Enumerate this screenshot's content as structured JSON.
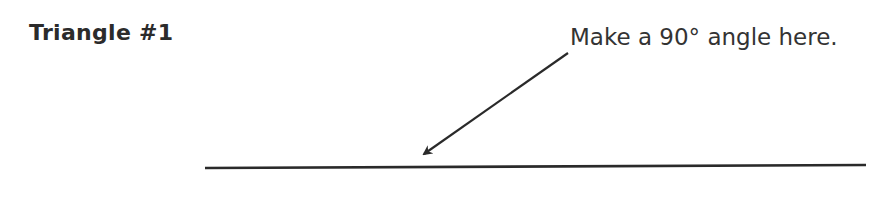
{
  "worksheet": {
    "title": "Triangle #1",
    "instruction": "Make a 90° angle here.",
    "arrow": {
      "x1": 568,
      "y1": 53,
      "x2": 422,
      "y2": 155
    },
    "baseline": {
      "x1": 205,
      "y1": 168,
      "x2": 866,
      "y2": 165
    },
    "ink_color": "#2a2a2a"
  }
}
